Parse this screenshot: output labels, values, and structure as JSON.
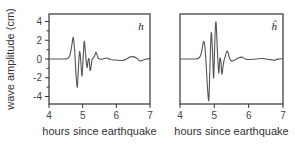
{
  "chart_data": [
    {
      "type": "line",
      "panel_label": "h",
      "xlabel": "hours since earthquake",
      "ylabel": "wave amplitude  (cm)",
      "xlim": [
        4,
        7
      ],
      "ylim": [
        -4.8,
        4.8
      ],
      "xticks": [
        4,
        5,
        6,
        7
      ],
      "xtick_labels": [
        "4",
        "5",
        "6",
        "7"
      ],
      "yticks": [
        4,
        2,
        0,
        -2,
        -4
      ],
      "ytick_labels": [
        "4",
        "2",
        "0",
        "-2",
        "-4"
      ],
      "yminor_ticks": [
        3,
        1,
        -1,
        -3
      ],
      "grid": false,
      "series": [
        {
          "name": "h",
          "x": [
            4.0,
            4.4,
            4.55,
            4.62,
            4.68,
            4.72,
            4.76,
            4.8,
            4.84,
            4.87,
            4.91,
            4.95,
            4.98,
            5.02,
            5.05,
            5.09,
            5.13,
            5.16,
            5.19,
            5.22,
            5.25,
            5.28,
            5.32,
            5.36,
            5.4,
            5.45,
            5.5,
            5.6,
            5.7,
            5.8,
            5.9,
            6.0,
            6.2,
            6.4,
            6.5,
            6.6,
            6.7,
            6.8,
            6.9,
            7.0
          ],
          "y": [
            0.0,
            0.0,
            0.05,
            0.4,
            1.5,
            2.3,
            1.0,
            -1.5,
            -3.0,
            -1.2,
            0.8,
            -0.5,
            -1.8,
            0.5,
            1.9,
            0.3,
            -0.9,
            -0.2,
            0.0,
            -1.2,
            -0.8,
            0.0,
            0.1,
            0.4,
            0.7,
            0.2,
            0.0,
            0.0,
            0.1,
            0.0,
            -0.1,
            -0.1,
            -0.15,
            0.2,
            0.25,
            0.1,
            -0.2,
            -0.1,
            0.0,
            0.05
          ]
        }
      ]
    },
    {
      "type": "line",
      "panel_label": "ĥ",
      "xlabel": "hours since earthquake",
      "ylabel": "",
      "xlim": [
        4,
        7
      ],
      "ylim": [
        -4.8,
        4.8
      ],
      "xticks": [
        4,
        5,
        6,
        7
      ],
      "xtick_labels": [
        "4",
        "5",
        "6",
        "7"
      ],
      "grid": false,
      "series": [
        {
          "name": "h-hat",
          "x": [
            4.0,
            4.4,
            4.55,
            4.62,
            4.68,
            4.72,
            4.76,
            4.8,
            4.84,
            4.87,
            4.91,
            4.95,
            4.98,
            5.02,
            5.05,
            5.09,
            5.13,
            5.16,
            5.19,
            5.22,
            5.25,
            5.28,
            5.32,
            5.36,
            5.4,
            5.45,
            5.5,
            5.6,
            5.7,
            5.8,
            5.9,
            6.0,
            6.2,
            6.4,
            6.6,
            6.7,
            6.75,
            6.8,
            6.9,
            7.0
          ],
          "y": [
            0.0,
            0.0,
            0.1,
            0.6,
            1.8,
            1.5,
            -0.5,
            -3.0,
            -4.4,
            -1.0,
            2.8,
            0.5,
            -2.0,
            2.5,
            3.9,
            0.8,
            -1.5,
            0.0,
            -0.2,
            -1.6,
            -0.9,
            -0.2,
            0.3,
            0.8,
            0.7,
            0.0,
            -0.2,
            -0.1,
            0.1,
            0.2,
            0.0,
            -0.05,
            0.0,
            0.05,
            -0.05,
            -0.1,
            -0.15,
            -0.05,
            0.0,
            0.05
          ]
        }
      ]
    }
  ]
}
